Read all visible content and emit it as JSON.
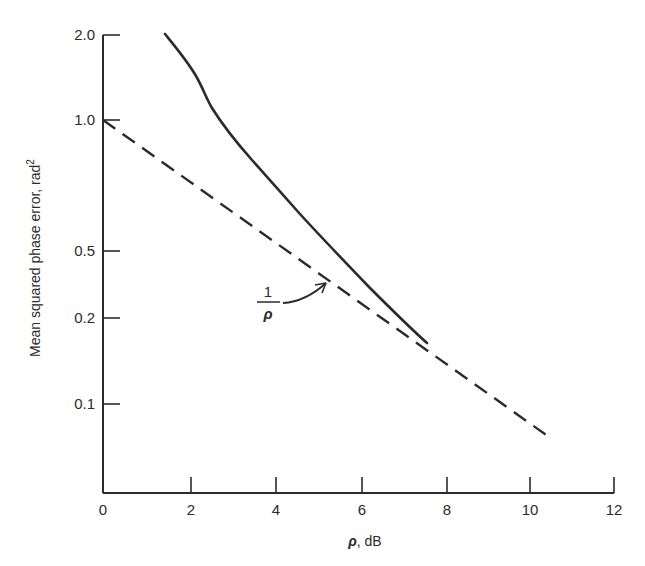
{
  "chart_data": {
    "type": "line",
    "title": "",
    "xlabel": "ρ, dB",
    "xlabel_parts": {
      "symbol": "ρ",
      "unit": ", dB"
    },
    "ylabel": "Mean squared phase error, rad²",
    "ylabel_parts": {
      "text": "Mean squared phase error, rad",
      "sup": "2"
    },
    "xlim": [
      0,
      12
    ],
    "ylim": [
      0.05,
      2.0
    ],
    "yscale": "log (irregular tick spacing)",
    "grid": false,
    "legend": "none",
    "x_ticks": [
      "0",
      "2",
      "4",
      "6",
      "8",
      "10",
      "12"
    ],
    "y_ticks": [
      "0.1",
      "0.2",
      "0.5",
      "1.0",
      "2.0"
    ],
    "series": [
      {
        "name": "Mean squared phase error (PLL)",
        "style": "solid",
        "x": [
          1.45,
          2.1,
          2.5,
          3.0,
          3.7,
          4.5,
          5.3,
          6.5,
          7.6
        ],
        "y": [
          2.0,
          1.5,
          1.1,
          0.9,
          0.75,
          0.57,
          0.5,
          0.3,
          0.22
        ]
      },
      {
        "name": "1/ρ",
        "style": "dashed",
        "x": [
          0,
          10.5
        ],
        "y": [
          1.0,
          0.08
        ]
      }
    ],
    "annotations": [
      {
        "text": "1/ρ",
        "numerator": "1",
        "denominator": "ρ",
        "arrow_to": "dashed line near ρ ≈ 5.3 dB"
      }
    ]
  },
  "render": {
    "color": "#2b2b2b",
    "axes": {
      "origin": [
        103,
        493
      ],
      "x_end": 614,
      "y_top": 35
    },
    "x_tick_px": [
      103,
      191,
      276,
      362,
      447,
      530,
      614
    ],
    "y_tick_px": [
      404,
      318,
      251,
      120,
      35
    ],
    "solid_path": "M165,34 C178,50 188,62 196,76 C203,88 206,98 212,108 C222,124 236,142 252,160 C268,178 284,196 300,214 C320,236 345,262 370,288 C390,308 410,328 427,343",
    "dashed_path": "M103,120 L549,437",
    "arrow_path": "M283,303 C300,302 314,294 326,283",
    "arrowhead": "M326,283 L315,285 M326,283 L322,293"
  }
}
